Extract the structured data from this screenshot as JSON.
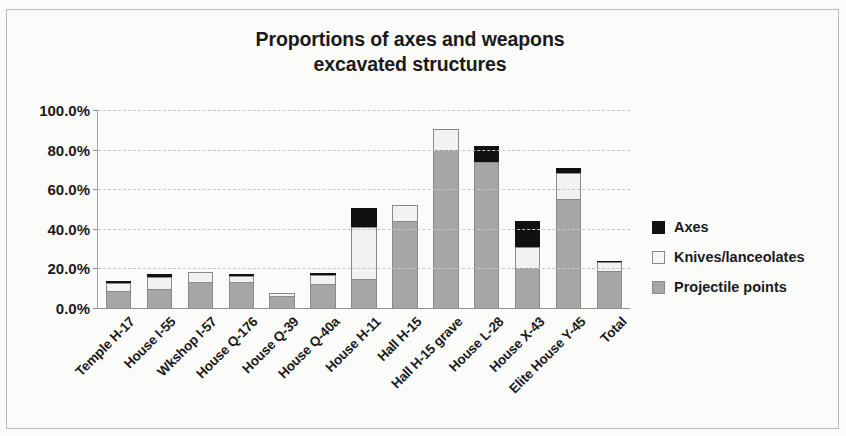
{
  "chart_data": {
    "type": "bar",
    "subtype": "stacked-bar",
    "title": "Proportions of axes and weapons",
    "title_line2": "excavated structures",
    "xlabel": "",
    "ylabel": "",
    "ylim": [
      0,
      100
    ],
    "y_tick_labels": [
      "100.0%",
      "80.0%",
      "60.0%",
      "40.0%",
      "20.0%",
      "0.0%"
    ],
    "y_tick_values": [
      100,
      80,
      60,
      40,
      20,
      0
    ],
    "grid": true,
    "legend_position": "right",
    "categories": [
      "Temple H-17",
      "House I-55",
      "Wkshop I-57",
      "House Q-176",
      "House Q-39",
      "House Q-40a",
      "House H-11",
      "Hall H-15",
      "Hall H-15 grave",
      "House L-28",
      "House X-43",
      "Elite House Y-45",
      "Total"
    ],
    "series": [
      {
        "name": "Projectile points",
        "color": "#a6a6a6",
        "values": [
          8.5,
          9.5,
          13.0,
          13.0,
          6.0,
          12.0,
          14.5,
          44.0,
          80.0,
          73.5,
          20.0,
          55.0,
          18.5
        ]
      },
      {
        "name": "Knives/lanceolates",
        "color": "#f2f2f2",
        "values": [
          4.0,
          6.0,
          5.0,
          3.0,
          1.5,
          4.5,
          26.5,
          8.0,
          10.5,
          0.0,
          11.0,
          13.0,
          4.5
        ]
      },
      {
        "name": "Axes",
        "color": "#101010",
        "values": [
          1.0,
          1.5,
          0.0,
          1.0,
          0.0,
          1.0,
          9.5,
          0.0,
          0.0,
          8.5,
          13.0,
          2.5,
          1.0
        ]
      }
    ],
    "totals": [
      13.5,
      17.0,
      18.0,
      17.0,
      7.5,
      17.5,
      50.5,
      52.0,
      90.5,
      82.0,
      44.0,
      70.5,
      24.0
    ]
  },
  "legend": {
    "items": [
      {
        "label": "Axes",
        "swatch": "black-square-icon"
      },
      {
        "label": "Knives/lanceolates",
        "swatch": "white-square-icon"
      },
      {
        "label": "Projectile points",
        "swatch": "gray-square-icon"
      }
    ]
  }
}
